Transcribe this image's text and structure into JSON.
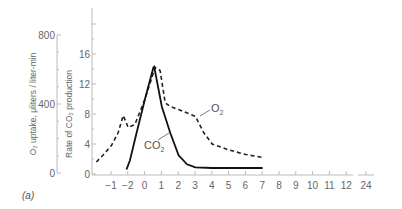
{
  "chart_data": {
    "type": "line",
    "title": "",
    "panel_label": "(a)",
    "xlabel": "",
    "x_ticks": [
      "−1",
      "−2",
      "0",
      "1",
      "2",
      "3",
      "4",
      "5",
      "6",
      "7",
      "8",
      "9",
      "10",
      "11",
      "12",
      "24"
    ],
    "y_left": {
      "label": "O₂ uptake, μliters / liter-min",
      "ticks": [
        "0",
        "400",
        "800"
      ],
      "ylim": [
        0,
        800
      ]
    },
    "y_right": {
      "label": "Rate of CO₂ production",
      "ticks": [
        "0",
        "4",
        "8",
        "12",
        "16"
      ],
      "ylim": [
        0,
        16
      ]
    },
    "grid": false,
    "legend": "inline labels",
    "series": [
      {
        "name": "O₂",
        "style": "dashed",
        "x": [
          -2.9,
          -2.5,
          -2.0,
          -1.6,
          -1.3,
          -1.0,
          -0.6,
          0.0,
          0.6,
          0.9,
          1.2,
          1.5,
          2.0,
          3.0,
          3.5,
          4.0,
          5.0,
          6.0,
          7.0
        ],
        "values": [
          1.6,
          2.5,
          3.8,
          5.5,
          7.8,
          6.2,
          6.6,
          10.0,
          14.2,
          13.8,
          9.5,
          9.0,
          8.6,
          7.7,
          5.5,
          4.0,
          3.2,
          2.6,
          2.2
        ]
      },
      {
        "name": "CO₂",
        "style": "solid",
        "x": [
          -1.1,
          -0.9,
          -0.5,
          0.0,
          0.5,
          0.55,
          1.0,
          1.5,
          2.0,
          2.5,
          3.0,
          4.0,
          5.0,
          6.0,
          7.0
        ],
        "values": [
          0.6,
          1.8,
          5.5,
          10.0,
          14.2,
          14.3,
          9.0,
          5.5,
          2.5,
          1.3,
          0.9,
          0.8,
          0.8,
          0.8,
          0.8
        ]
      }
    ]
  },
  "labels": {
    "o2": "O",
    "o2_sub": "2",
    "co2": "CO",
    "co2_sub": "2"
  }
}
